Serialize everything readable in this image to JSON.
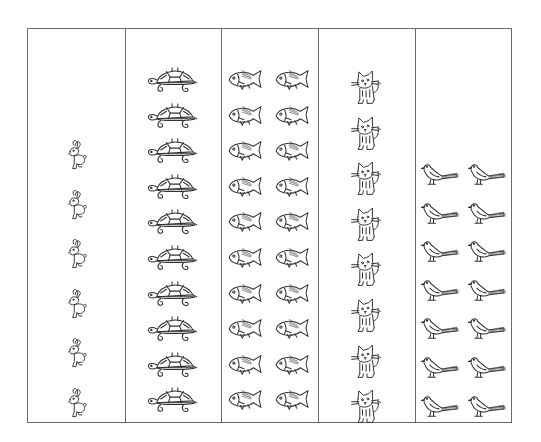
{
  "worksheet": {
    "columns": [
      {
        "animal": "rabbit",
        "icon": "rabbit-icon",
        "count": 6,
        "per_row": 1,
        "rows": 6
      },
      {
        "animal": "turtle",
        "icon": "turtle-icon",
        "count": 10,
        "per_row": 1,
        "rows": 10
      },
      {
        "animal": "fish",
        "icon": "fish-icon",
        "count": 20,
        "per_row": 2,
        "rows": 10
      },
      {
        "animal": "cat",
        "icon": "cat-icon",
        "count": 8,
        "per_row": 1,
        "rows": 8
      },
      {
        "animal": "bird",
        "icon": "bird-icon",
        "count": 14,
        "per_row": 2,
        "rows": 7
      }
    ],
    "colors": {
      "line": "#6a6a6a",
      "ink": "#333333",
      "background": "#ffffff"
    }
  }
}
